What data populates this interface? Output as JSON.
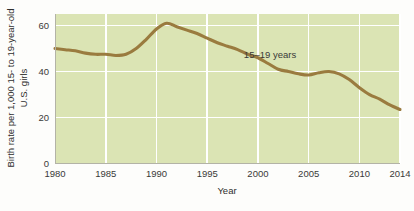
{
  "chart_data": {
    "type": "line",
    "title": "",
    "xlabel": "Year",
    "ylabel": "Birth rate per 1,000 15- to 19-year-old U.S. girls",
    "ylabel_line1": "Birth rate per 1,000 15- to 19-year-old",
    "ylabel_line2": "U.S. girls",
    "xlim": [
      1980,
      2014
    ],
    "ylim": [
      0,
      65
    ],
    "xticks": [
      1980,
      1985,
      1990,
      1995,
      2000,
      2005,
      2010,
      2014
    ],
    "xtick_labels": [
      "1980",
      "1985",
      "1990",
      "1995",
      "2000",
      "2005",
      "2010",
      "2014"
    ],
    "yticks": [
      0,
      20,
      40,
      60
    ],
    "ytick_labels": [
      "0",
      "20",
      "40",
      "60"
    ],
    "grid": true,
    "grid_color": "#ffffff",
    "plot_background": "#dbe4b4",
    "legend_position": "inline-annotation",
    "series": [
      {
        "name": "15–19 years",
        "annotation": "15–19 years",
        "color": "#9a7b3f",
        "x": [
          1980,
          1981,
          1982,
          1983,
          1984,
          1985,
          1986,
          1987,
          1988,
          1989,
          1990,
          1991,
          1992,
          1993,
          1994,
          1995,
          1996,
          1997,
          1998,
          1999,
          2000,
          2001,
          2002,
          2003,
          2004,
          2005,
          2006,
          2007,
          2008,
          2009,
          2010,
          2011,
          2012,
          2013,
          2014
        ],
        "values": [
          50.0,
          49.5,
          49.0,
          48.0,
          47.5,
          47.5,
          47.0,
          47.5,
          50.0,
          54.0,
          58.5,
          61.0,
          59.5,
          58.0,
          56.5,
          54.5,
          52.5,
          51.0,
          49.5,
          47.5,
          46.0,
          43.5,
          41.0,
          40.0,
          39.0,
          38.5,
          39.5,
          40.0,
          39.0,
          36.5,
          33.0,
          30.0,
          28.0,
          25.5,
          23.5
        ]
      }
    ]
  },
  "axis": {
    "x_title": "Year",
    "y_title_line1": "Birth rate per 1,000 15- to 19-year-old",
    "y_title_line2": "U.S. girls"
  },
  "ticks": {
    "x": [
      "1980",
      "1985",
      "1990",
      "1995",
      "2000",
      "2005",
      "2010",
      "2014"
    ],
    "y": [
      "0",
      "20",
      "40",
      "60"
    ]
  },
  "annotations": {
    "series_label": "15–19 years"
  },
  "colors": {
    "line": "#9a7b3f",
    "plot_bg": "#dbe4b4",
    "grid": "#ffffff",
    "text": "#3a3a38",
    "page_bg": "#fdfdfb"
  }
}
